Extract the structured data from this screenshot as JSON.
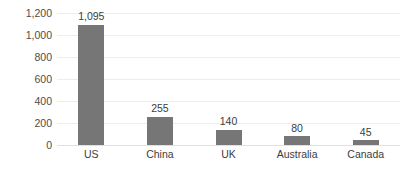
{
  "chart_data": {
    "type": "bar",
    "title": "",
    "subtitle": "",
    "xlabel": "",
    "ylabel": "",
    "categories": [
      "US",
      "China",
      "UK",
      "Australia",
      "Canada"
    ],
    "values": [
      1095,
      255,
      140,
      80,
      45
    ],
    "value_labels": [
      "1,095",
      "255",
      "140",
      "80",
      "45"
    ],
    "ylim": [
      0,
      1200
    ],
    "ytick_values": [
      0,
      200,
      400,
      600,
      800,
      1000,
      1200
    ],
    "ytick_labels": [
      "0",
      "200",
      "400",
      "600",
      "800",
      "1,000",
      "1,200"
    ],
    "grid": true,
    "grid_axis": "y",
    "legend": false,
    "legend_position": "none",
    "orientation": "vertical",
    "bar_color": "#767676",
    "gridline_color": "#ededed",
    "background_color": "#ffffff",
    "label_color": "#3d3d3d",
    "axis_label_color": "#4d4d4d"
  }
}
